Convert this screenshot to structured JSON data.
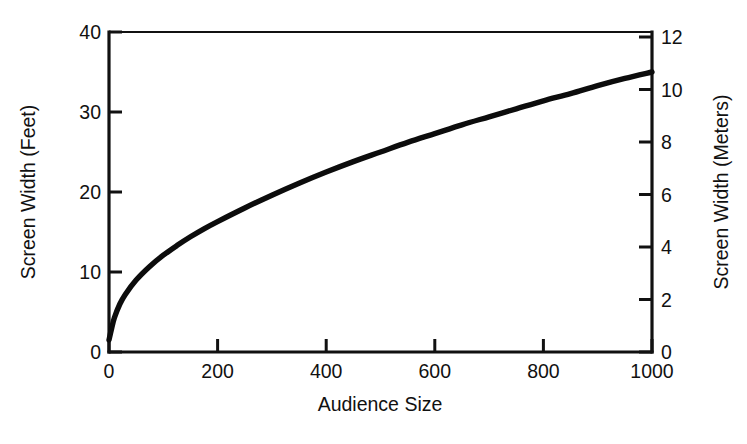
{
  "chart_data": {
    "type": "line",
    "title": "",
    "xlabel": "Audience Size",
    "ylabel": "Screen Width (Feet)",
    "y2label": "Screen Width (Meters)",
    "xlim": [
      0,
      1000
    ],
    "ylim": [
      0,
      40
    ],
    "y2lim": [
      0,
      12.192
    ],
    "grid": false,
    "legend": null,
    "xticks": [
      0,
      200,
      400,
      600,
      800,
      1000
    ],
    "xticklabels": [
      "0",
      "200",
      "400",
      "600",
      "800",
      "1000"
    ],
    "yticks": [
      0,
      10,
      20,
      30,
      40
    ],
    "yticklabels": [
      "0",
      "10",
      "20",
      "30",
      "40"
    ],
    "y2ticks": [
      0,
      2,
      4,
      6,
      8,
      10,
      12
    ],
    "y2ticklabels": [
      "0",
      "2",
      "4",
      "6",
      "8",
      "10",
      "12"
    ],
    "series": [
      {
        "name": "Recommended Screen Width",
        "x": [
          0,
          5,
          10,
          20,
          30,
          50,
          75,
          100,
          125,
          150,
          175,
          200,
          250,
          300,
          350,
          400,
          450,
          500,
          550,
          600,
          650,
          700,
          750,
          800,
          850,
          900,
          950,
          1000
        ],
        "values": [
          1.5,
          3.0,
          4.3,
          6.0,
          7.2,
          9.0,
          10.7,
          12.1,
          13.3,
          14.4,
          15.4,
          16.3,
          18.0,
          19.6,
          21.1,
          22.5,
          23.8,
          25.0,
          26.2,
          27.3,
          28.4,
          29.4,
          30.4,
          31.4,
          32.3,
          33.3,
          34.2,
          35.0
        ]
      }
    ],
    "curve_note": "Monotone increasing square-root style curve from about 1.5 feet at audience 0 to about 37 feet at audience 1000",
    "colors": {
      "curve": "#0c0c0c",
      "axis": "#111111",
      "background": "#ffffff"
    }
  },
  "axes": {
    "left_title": "Screen Width (Feet)",
    "right_title": "Screen Width (Meters)",
    "bottom_title": "Audience Size"
  }
}
